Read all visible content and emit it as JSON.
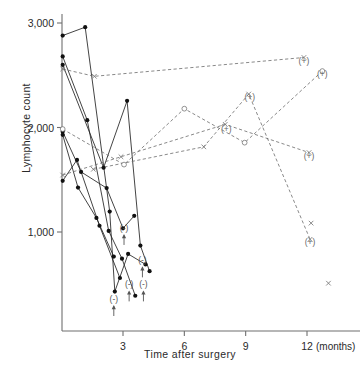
{
  "chart_data": {
    "type": "line",
    "title": "",
    "xlabel": "Time after surgery",
    "xunit": "(months)",
    "ylabel": "Lymphocyte count",
    "xlim": [
      0,
      12.9
    ],
    "ylim": [
      0,
      3250
    ],
    "grid": false,
    "legend": "none",
    "x_ticks": [
      3,
      6,
      9,
      12
    ],
    "x_tick_labels": [
      "3",
      "6",
      "9",
      "12"
    ],
    "y_ticks": [
      1000,
      2000,
      3000
    ],
    "y_tick_labels": [
      "1,000",
      "2,000",
      "3,000"
    ],
    "marker_legend": {
      "filled_circle": "recurrence-negative patient (solid line)",
      "cross": "recurrence-positive patient (dashed line)",
      "open_circle": "recurrence-positive patient (dashed line)",
      "open_square": "recurrence-positive patient (dashed line)"
    },
    "annotations": [
      {
        "text": "(-)",
        "arrow": "up",
        "x": 3.05,
        "y": 1010
      },
      {
        "text": "(-)",
        "arrow": "up",
        "x": 3.95,
        "y": 700
      },
      {
        "text": "(-)",
        "arrow": "up",
        "x": 3.3,
        "y": 470
      },
      {
        "text": "(-)",
        "arrow": "up",
        "x": 4.0,
        "y": 470
      },
      {
        "text": "(-)",
        "arrow": "up",
        "x": 2.55,
        "y": 330
      },
      {
        "text": "(+)",
        "x": 11.85,
        "y": 2610
      },
      {
        "text": "(+)",
        "x": 12.75,
        "y": 2480
      },
      {
        "text": "(+)",
        "x": 9.2,
        "y": 2260
      },
      {
        "text": "(+)",
        "x": 8.05,
        "y": 1960
      },
      {
        "text": "(+)",
        "x": 12.1,
        "y": 1700
      },
      {
        "text": "(+)",
        "x": 12.15,
        "y": 880
      }
    ],
    "series": [
      {
        "name": "patient-1",
        "style": "solid",
        "marker": "filled_circle",
        "points": [
          [
            0.05,
            2880
          ],
          [
            1.15,
            2960
          ],
          [
            2.35,
            1195
          ],
          [
            2.6,
            430
          ],
          [
            3.25,
            790
          ],
          [
            4.1,
            690
          ]
        ]
      },
      {
        "name": "patient-2",
        "style": "solid",
        "marker": "filled_circle",
        "points": [
          [
            0.05,
            2680
          ],
          [
            1.25,
            2070
          ],
          [
            2.3,
            1010
          ],
          [
            2.95,
            745
          ],
          [
            3.6,
            390
          ]
        ]
      },
      {
        "name": "patient-3",
        "style": "solid",
        "marker": "filled_circle",
        "points": [
          [
            0.05,
            2600
          ],
          [
            2.05,
            1615
          ],
          [
            3.2,
            2255
          ],
          [
            3.85,
            870
          ],
          [
            4.3,
            625
          ]
        ]
      },
      {
        "name": "patient-4",
        "style": "solid",
        "marker": "filled_circle",
        "points": [
          [
            0.05,
            1960
          ],
          [
            0.95,
            1575
          ],
          [
            2.2,
            1420
          ],
          [
            3.0,
            1035
          ],
          [
            3.55,
            1155
          ]
        ]
      },
      {
        "name": "patient-5",
        "style": "solid",
        "marker": "filled_circle",
        "points": [
          [
            0.05,
            1930
          ],
          [
            0.8,
            1425
          ],
          [
            1.7,
            1135
          ],
          [
            2.55,
            765
          ]
        ]
      },
      {
        "name": "patient-6",
        "style": "solid",
        "marker": "filled_circle",
        "points": [
          [
            0.05,
            1490
          ],
          [
            0.75,
            1690
          ],
          [
            1.85,
            1060
          ],
          [
            2.85,
            560
          ]
        ]
      },
      {
        "name": "patient-7",
        "style": "dashed",
        "marker": "cross",
        "points": [
          [
            0.05,
            2560
          ],
          [
            1.6,
            2490
          ],
          [
            11.85,
            2670
          ]
        ]
      },
      {
        "name": "patient-8",
        "style": "dashed",
        "marker": "open_circle",
        "points": [
          [
            0.05,
            1985
          ],
          [
            3.05,
            1645
          ],
          [
            6.0,
            2180
          ],
          [
            8.95,
            1855
          ],
          [
            12.75,
            2540
          ]
        ]
      },
      {
        "name": "patient-9",
        "style": "dashed",
        "marker": "cross",
        "points": [
          [
            0.05,
            1545
          ],
          [
            2.9,
            1720
          ],
          [
            8.0,
            2030
          ],
          [
            12.1,
            1760
          ]
        ]
      },
      {
        "name": "patient-10",
        "style": "dashed",
        "marker": "cross",
        "points": [
          [
            1.55,
            1600
          ],
          [
            6.95,
            1815
          ],
          [
            9.15,
            2320
          ],
          [
            12.15,
            930
          ]
        ]
      }
    ],
    "isolated_points": [
      {
        "marker": "cross",
        "x": 12.2,
        "y": 1085
      },
      {
        "marker": "cross",
        "x": 13.05,
        "y": 510
      }
    ]
  }
}
